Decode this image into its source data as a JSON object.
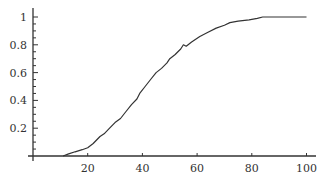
{
  "chart_data": {
    "type": "line",
    "title": "",
    "xlabel": "",
    "ylabel": "",
    "xlim": [
      0,
      103
    ],
    "ylim": [
      0,
      1.04
    ],
    "grid": false,
    "legend": null,
    "x_ticks": [
      20,
      40,
      60,
      80,
      100
    ],
    "x_tick_labels": [
      "20",
      "40",
      "60",
      "80",
      "100"
    ],
    "y_ticks": [
      0.2,
      0.4,
      0.6,
      0.8,
      1
    ],
    "y_tick_labels": [
      "0.2",
      "0.4",
      "0.6",
      "0.8",
      "1"
    ],
    "y_minor_step": 0.05,
    "series": [
      {
        "name": "cumulative",
        "color": "#333333",
        "x": [
          11,
          13,
          15.4,
          18,
          20,
          22,
          24.5,
          26,
          28,
          30,
          32,
          34,
          36,
          38,
          39,
          41,
          43,
          45,
          47,
          49,
          50,
          52,
          54,
          55,
          56,
          58,
          61,
          64,
          67,
          70,
          72,
          75,
          79,
          82,
          84,
          90,
          95,
          100
        ],
        "y": [
          0,
          0.015,
          0.03,
          0.045,
          0.06,
          0.09,
          0.14,
          0.16,
          0.2,
          0.24,
          0.27,
          0.32,
          0.37,
          0.41,
          0.45,
          0.5,
          0.55,
          0.6,
          0.63,
          0.67,
          0.7,
          0.73,
          0.77,
          0.8,
          0.79,
          0.82,
          0.86,
          0.89,
          0.92,
          0.94,
          0.96,
          0.97,
          0.98,
          0.99,
          1.0,
          1.0,
          1.0,
          1.0
        ]
      }
    ]
  }
}
